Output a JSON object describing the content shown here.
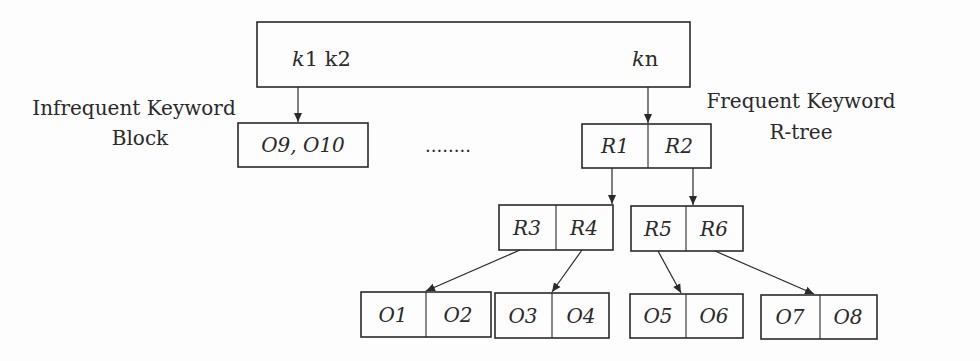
{
  "diagram": {
    "top_node": {
      "left_keys": {
        "k1_italic": "k",
        "k1_rest": "1 k2"
      },
      "right_key": {
        "italic": "k",
        "rest": "n"
      }
    },
    "labels": {
      "infrequent_line1": "Infrequent Keyword",
      "infrequent_line2": "Block",
      "frequent_line1": "Frequent Keyword",
      "frequent_line2": "R-tree"
    },
    "ellipsis": "........",
    "infrequent_block": "O9, O10",
    "rtree": {
      "root": [
        "R1",
        "R2"
      ],
      "level1": [
        [
          "R3",
          "R4"
        ],
        [
          "R5",
          "R6"
        ]
      ],
      "leaves": [
        [
          "O1",
          "O2"
        ],
        [
          "O3",
          "O4"
        ],
        [
          "O5",
          "O6"
        ],
        [
          "O7",
          "O8"
        ]
      ]
    },
    "colors": {
      "stroke": "#2a2a2a",
      "background": "#fdfdfd"
    }
  }
}
